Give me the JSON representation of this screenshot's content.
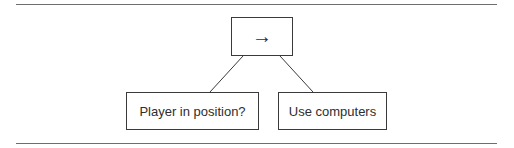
{
  "diagram": {
    "type": "behavior-tree",
    "root": {
      "symbol": "→",
      "icon": "sequence-arrow-icon"
    },
    "children": [
      {
        "label": "Player in position?"
      },
      {
        "label": "Use computers"
      }
    ]
  },
  "colors": {
    "stroke": "#3a3a3a",
    "text": "#2e2e2e",
    "rule": "#6e6e6e",
    "background": "#ffffff"
  }
}
